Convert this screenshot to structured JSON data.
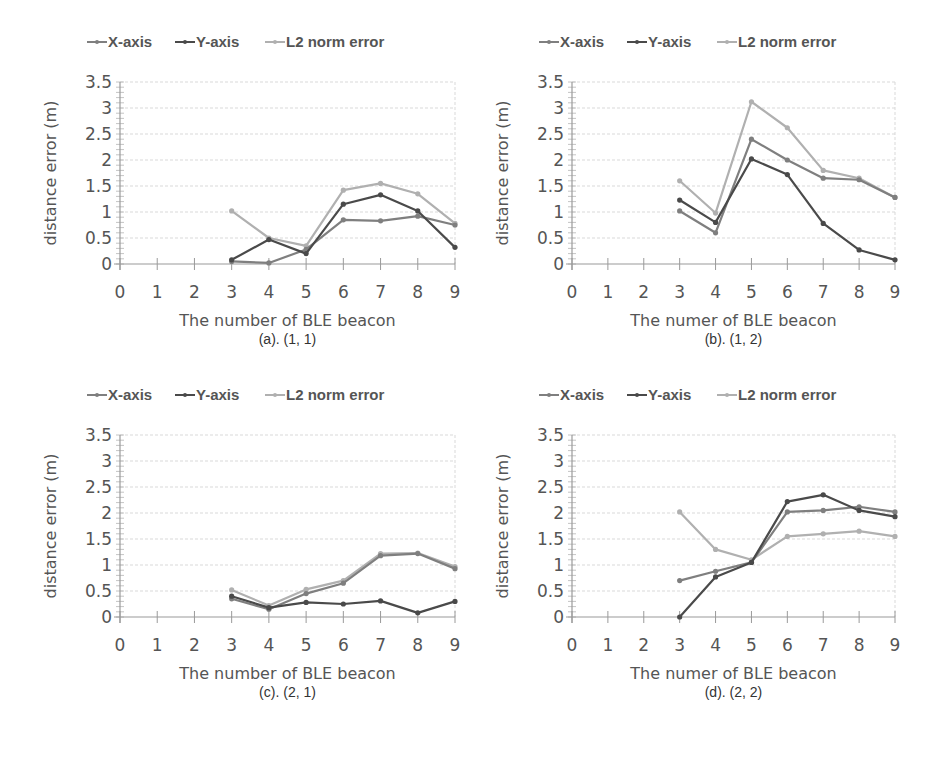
{
  "chart_data": [
    {
      "type": "line",
      "id": "a",
      "caption": "(a). (1, 1)",
      "xlabel": "The number of BLE beacon",
      "ylabel": "distance error (m)",
      "x": [
        3,
        4,
        5,
        6,
        7,
        8,
        9
      ],
      "xticks": [
        "0",
        "1",
        "2",
        "3",
        "4",
        "5",
        "6",
        "7",
        "8",
        "9"
      ],
      "yticks": [
        "0",
        "0.5",
        "1",
        "1.5",
        "2",
        "2.5",
        "3",
        "3.5"
      ],
      "xlim": [
        0,
        9
      ],
      "ylim": [
        0,
        3.5
      ],
      "grid": true,
      "legend_position": "top",
      "series": [
        {
          "name": "X-axis",
          "color": "#7f7f7f",
          "values": [
            0.05,
            0.02,
            0.28,
            0.85,
            0.83,
            0.92,
            0.75
          ]
        },
        {
          "name": "Y-axis",
          "color": "#4a4a4a",
          "values": [
            0.08,
            0.47,
            0.2,
            1.15,
            1.33,
            1.02,
            0.32
          ]
        },
        {
          "name": "L2 norm error",
          "color": "#b0b0b0",
          "values": [
            1.02,
            0.5,
            0.35,
            1.42,
            1.55,
            1.35,
            0.78
          ]
        }
      ]
    },
    {
      "type": "line",
      "id": "b",
      "caption": "(b). (1, 2)",
      "xlabel": "The numer of BLE beacon",
      "ylabel": "distance error (m)",
      "x": [
        3,
        4,
        5,
        6,
        7,
        8,
        9
      ],
      "xticks": [
        "0",
        "1",
        "2",
        "3",
        "4",
        "5",
        "6",
        "7",
        "8",
        "9"
      ],
      "yticks": [
        "0",
        "0.5",
        "1",
        "1.5",
        "2",
        "2.5",
        "3",
        "3.5"
      ],
      "xlim": [
        0,
        9
      ],
      "ylim": [
        0,
        3.5
      ],
      "grid": true,
      "legend_position": "top",
      "series": [
        {
          "name": "X-axis",
          "color": "#7f7f7f",
          "values": [
            1.02,
            0.6,
            2.4,
            2.0,
            1.65,
            1.62,
            1.28
          ]
        },
        {
          "name": "Y-axis",
          "color": "#4a4a4a",
          "values": [
            1.23,
            0.8,
            2.02,
            1.72,
            0.78,
            0.27,
            0.08
          ]
        },
        {
          "name": "L2 norm error",
          "color": "#b0b0b0",
          "values": [
            1.6,
            0.98,
            3.12,
            2.62,
            1.8,
            1.65,
            1.28
          ]
        }
      ]
    },
    {
      "type": "line",
      "id": "c",
      "caption": "(c). (2, 1)",
      "xlabel": "The number of BLE beacon",
      "ylabel": "distance error (m)",
      "x": [
        3,
        4,
        5,
        6,
        7,
        8,
        9
      ],
      "xticks": [
        "0",
        "1",
        "2",
        "3",
        "4",
        "5",
        "6",
        "7",
        "8",
        "9"
      ],
      "yticks": [
        "0",
        "0.5",
        "1",
        "1.5",
        "2",
        "2.5",
        "3",
        "3.5"
      ],
      "xlim": [
        0,
        9
      ],
      "ylim": [
        0,
        3.5
      ],
      "grid": true,
      "legend_position": "top",
      "series": [
        {
          "name": "X-axis",
          "color": "#7f7f7f",
          "values": [
            0.35,
            0.15,
            0.45,
            0.65,
            1.18,
            1.22,
            0.93
          ]
        },
        {
          "name": "Y-axis",
          "color": "#4a4a4a",
          "values": [
            0.4,
            0.18,
            0.28,
            0.25,
            0.31,
            0.08,
            0.3
          ]
        },
        {
          "name": "L2 norm error",
          "color": "#b0b0b0",
          "values": [
            0.52,
            0.22,
            0.53,
            0.7,
            1.22,
            1.23,
            0.97
          ]
        }
      ]
    },
    {
      "type": "line",
      "id": "d",
      "caption": "(d). (2, 2)",
      "xlabel": "The numer of BLE beacon",
      "ylabel": "distance error (m)",
      "x": [
        3,
        4,
        5,
        6,
        7,
        8,
        9
      ],
      "xticks": [
        "0",
        "1",
        "2",
        "3",
        "4",
        "5",
        "6",
        "7",
        "8",
        "9"
      ],
      "yticks": [
        "0",
        "0.5",
        "1",
        "1.5",
        "2",
        "2.5",
        "3",
        "3.5"
      ],
      "xlim": [
        0,
        9
      ],
      "ylim": [
        0,
        3.5
      ],
      "grid": true,
      "legend_position": "top",
      "series": [
        {
          "name": "X-axis",
          "color": "#7f7f7f",
          "values": [
            0.7,
            0.88,
            1.05,
            2.02,
            2.05,
            2.12,
            2.02
          ]
        },
        {
          "name": "Y-axis",
          "color": "#4a4a4a",
          "values": [
            0.0,
            0.77,
            1.05,
            2.22,
            2.35,
            2.05,
            1.93
          ]
        },
        {
          "name": "L2 norm error",
          "color": "#b0b0b0",
          "values": [
            2.02,
            1.3,
            1.1,
            1.55,
            1.6,
            1.65,
            1.55
          ]
        }
      ]
    }
  ]
}
